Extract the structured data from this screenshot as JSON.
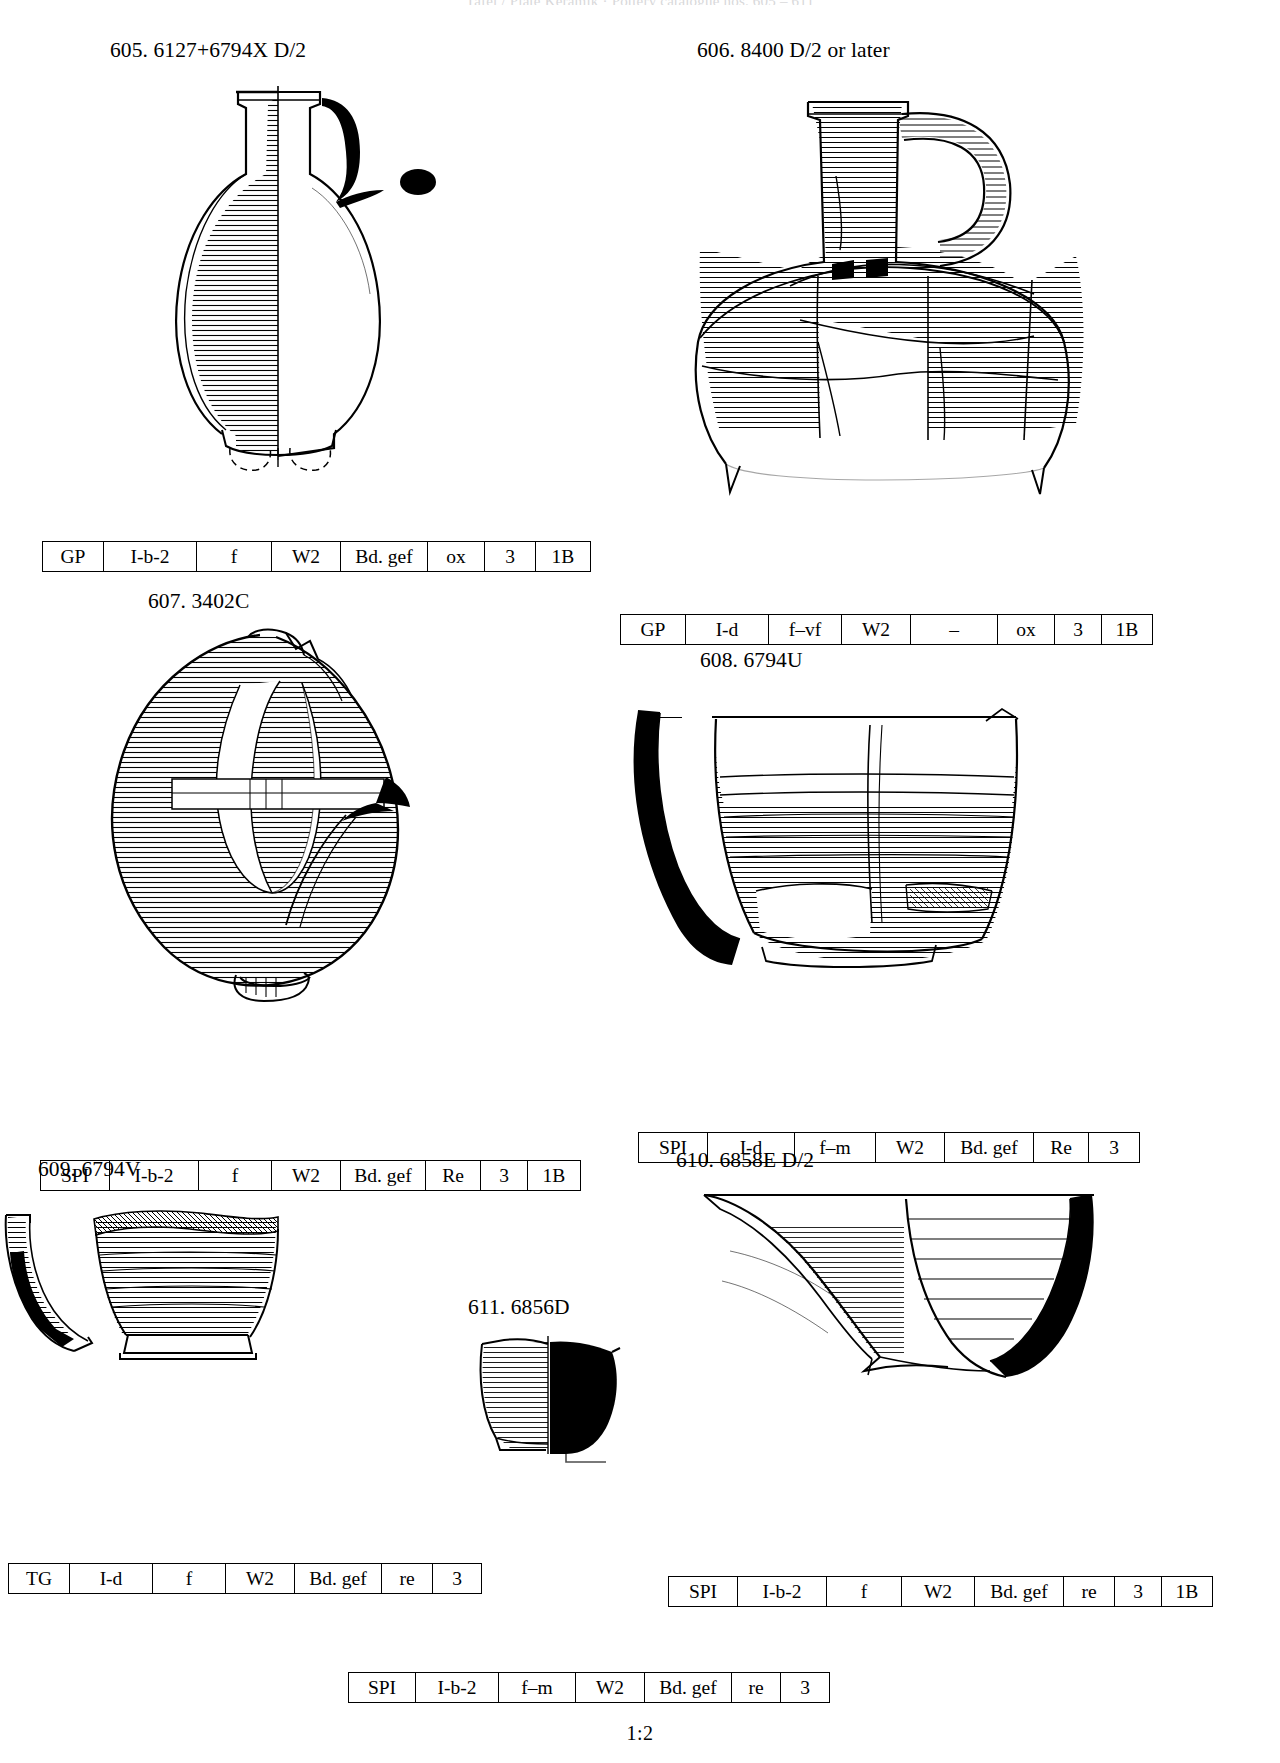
{
  "page": {
    "running_head": "Tafel / Plate   Keramik  ·  Pottery  catalogue  nos. 605 – 611",
    "scale_note": "1:2",
    "ink_color": "#000000",
    "paper_color": "#ffffff"
  },
  "table_columns": [
    "ware",
    "fabric",
    "temper",
    "surface",
    "rim",
    "firing",
    "hardness",
    "group"
  ],
  "entries": [
    {
      "id": "605",
      "number": "605.",
      "find_no": "6127+6794X",
      "phase": "D/2",
      "caption": "605. 6127+6794X   D/2",
      "attributes": [
        "GP",
        "I-b-2",
        "f",
        "W2",
        "Bd. gef",
        "ox",
        "3",
        "1B"
      ]
    },
    {
      "id": "606",
      "number": "606.",
      "find_no": "8400",
      "phase": "D/2 or later",
      "caption": "606. 8400   D/2 or later",
      "attributes": [
        "GP",
        "I-d",
        "f–vf",
        "W2",
        "–",
        "ox",
        "3",
        "1B"
      ]
    },
    {
      "id": "607",
      "number": "607.",
      "find_no": "3402C",
      "phase": "",
      "caption": "607. 3402C",
      "attributes": [
        "SPI",
        "I-b-2",
        "f",
        "W2",
        "Bd. gef",
        "Re",
        "3",
        "1B"
      ]
    },
    {
      "id": "608",
      "number": "608.",
      "find_no": "6794U",
      "phase": "",
      "caption": "608. 6794U",
      "attributes": [
        "SPI",
        "I-d",
        "f–m",
        "W2",
        "Bd. gef",
        "Re",
        "3"
      ]
    },
    {
      "id": "609",
      "number": "609.",
      "find_no": "6794V",
      "phase": "",
      "caption": "609. 6794V",
      "attributes": [
        "TG",
        "I-d",
        "f",
        "W2",
        "Bd. gef",
        "re",
        "3"
      ]
    },
    {
      "id": "610",
      "number": "610.",
      "find_no": "6858E",
      "phase": "D/2",
      "caption": "610. 6858E   D/2",
      "attributes": [
        "SPI",
        "I-b-2",
        "f",
        "W2",
        "Bd. gef",
        "re",
        "3",
        "1B"
      ]
    },
    {
      "id": "611",
      "number": "611.",
      "find_no": "6856D",
      "phase": "",
      "caption": "611. 6856D",
      "attributes": [
        "SPI",
        "I-b-2",
        "f–m",
        "W2",
        "Bd. gef",
        "re",
        "3"
      ]
    }
  ],
  "figures": {
    "fig605": {
      "name": "piriform-jar-drawing",
      "shape": "tall necked piriform jar, sectioned left half hatched, right half solid-black section with applied blob"
    },
    "fig606": {
      "name": "handled-jar-drawing",
      "shape": "wide ovoid jar with tall neck and single vertical strap handle, reconstructed from sherds"
    },
    "fig607": {
      "name": "large-ovoid-jar-drawing",
      "shape": "large squat ovoid jar with small ring base and pinched rim"
    },
    "fig608": {
      "name": "carinated-bowl-drawing",
      "shape": "deep bowl, left profile in black section, horizontal burnish lines"
    },
    "fig609": {
      "name": "small-bowl-drawing",
      "shape": "small carinated bowl on pedestal foot, black section at left"
    },
    "fig610": {
      "name": "large-open-bowl-drawing",
      "shape": "large open bowl, black section at right, horizontal lines inside"
    },
    "fig611": {
      "name": "base-sherd-drawing",
      "shape": "small base sherd, right half black section"
    }
  }
}
